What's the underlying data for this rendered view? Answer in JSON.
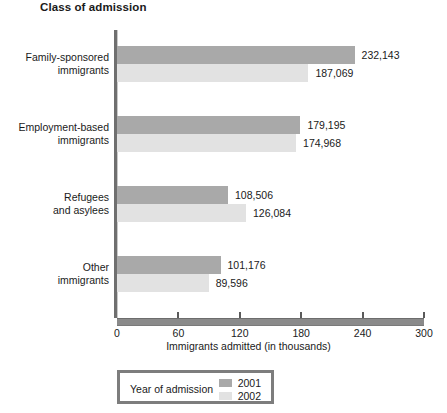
{
  "chart_data": {
    "type": "bar",
    "orientation": "horizontal",
    "title": "Class of admission",
    "xlabel": "Immigrants admitted (in thousands)",
    "ylabel": "",
    "xlim": [
      0,
      300
    ],
    "xticks": [
      0,
      60,
      120,
      180,
      240,
      300
    ],
    "xtick_labels": [
      "0",
      "60",
      "120",
      "180",
      "240",
      "300"
    ],
    "grid": false,
    "legend": {
      "title": "Year of admission",
      "position": "below-axis-left",
      "entries": [
        {
          "label": "2001",
          "color": "#a9a9a9"
        },
        {
          "label": "2002",
          "color": "#e2e2e2"
        }
      ]
    },
    "categories": [
      "Family-sponsored immigrants",
      "Employment-based immigrants",
      "Refugees and asylees",
      "Other immigrants"
    ],
    "category_lines": [
      [
        "Family-sponsored",
        "immigrants"
      ],
      [
        "Employment-based",
        "immigrants"
      ],
      [
        "Refugees",
        "and asylees"
      ],
      [
        "Other",
        "immigrants"
      ]
    ],
    "series": [
      {
        "name": "2001",
        "color": "#a9a9a9",
        "values": [
          232143,
          179195,
          108506,
          101176
        ],
        "value_labels": [
          "232,143",
          "179,195",
          "108,506",
          "101,176"
        ]
      },
      {
        "name": "2002",
        "color": "#e2e2e2",
        "values": [
          187069,
          174968,
          126084,
          89596
        ],
        "value_labels": [
          "187,069",
          "174,968",
          "126,084",
          "89,596"
        ]
      }
    ],
    "units": "thousands",
    "value_scale_divisor": 1000
  },
  "colors": {
    "series_2001": "#a9a9a9",
    "series_2002": "#e2e2e2",
    "axis": "#7a7a7a",
    "text": "#1a1a1a",
    "legend_border": "#7d7d7d"
  }
}
